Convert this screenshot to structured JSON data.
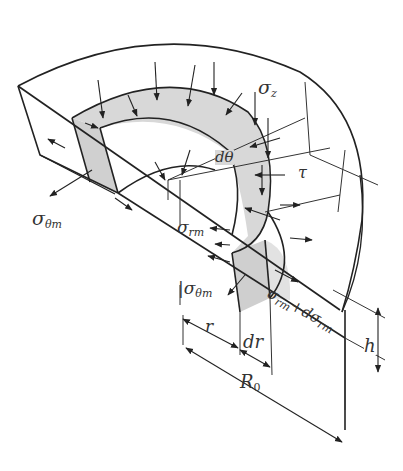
{
  "figure": {
    "labels": {
      "sigma_z": {
        "base": "σ",
        "sub": "z"
      },
      "d_theta": "dθ",
      "tau": "τ",
      "sigma_theta_m_left": {
        "base": "σ",
        "sub": "θm"
      },
      "sigma_rm": {
        "base": "σ",
        "sub": "rm"
      },
      "sigma_theta_m_front": {
        "base": "|σ",
        "sub": "θm"
      },
      "sigma_rm_plus": {
        "base": "σ",
        "sub": "rm",
        "plus": "+dσ",
        "sub2": "rm"
      },
      "r": "r",
      "dr": "dr",
      "R0": {
        "base": "R",
        "sub": "0"
      },
      "h": "h"
    },
    "colors": {
      "line": "#222222",
      "shade": "#d4d4d4",
      "shade_light": "#e6e6e6",
      "background": "#ffffff"
    }
  }
}
